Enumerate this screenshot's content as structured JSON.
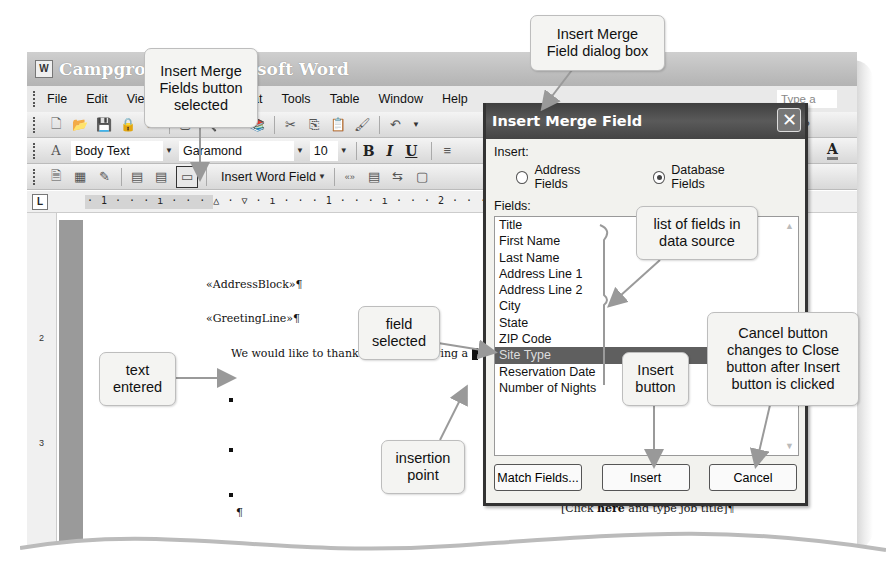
{
  "window": {
    "title": "Campground - Microsoft Word",
    "title_visible_left": "Campgroun",
    "title_visible_right": "Microsoft Word",
    "app_icon": "word-doc-icon"
  },
  "menubar": {
    "items": [
      "File",
      "Edit",
      "View",
      "Insert",
      "Format",
      "Tools",
      "Table",
      "Window",
      "Help"
    ],
    "ask_placeholder": "Type a que"
  },
  "formatting_toolbar": {
    "style": "Body Text",
    "font": "Garamond",
    "size": "10",
    "bold": "B",
    "italic": "I",
    "underline": "U",
    "font_color": "A"
  },
  "mail_merge_toolbar": {
    "insert_word_field": "Insert Word Field",
    "merge_field_glyph": "«»"
  },
  "ruler": {
    "marks": "· 1 · · · ı · · · △ · ▽ · ı · · · 1 · · · ı · · · 2 · · · ı",
    "tab_selector": "L"
  },
  "vertical_ruler": {
    "labels": [
      "2",
      "3"
    ]
  },
  "document": {
    "address_block": "«AddressBlock»¶",
    "greeting_line": "«GreetingLine»¶",
    "body_text": "We would like to thank you for reserving a",
    "para_mark": "¶",
    "job_title_placeholder": "[Click here and type job title]¶",
    "job_title_prefix": "[Click ",
    "job_title_bold": "here",
    "job_title_suffix": " and type job title]¶"
  },
  "dialog": {
    "title": "Insert Merge Field",
    "close_glyph": "✕",
    "insert_label": "Insert:",
    "radio_address": "Address Fields",
    "radio_database": "Database Fields",
    "radio_selected": "Database Fields",
    "fields_label": "Fields:",
    "fields": [
      "Title",
      "First Name",
      "Last Name",
      "Address Line 1",
      "Address Line 2",
      "City",
      "State",
      "ZIP Code",
      "Site Type",
      "Reservation Date",
      "Number of Nights"
    ],
    "selected_field": "Site Type",
    "buttons": {
      "match_fields": "Match Fields...",
      "insert": "Insert",
      "cancel": "Cancel"
    }
  },
  "callouts": {
    "insert_merge_fields_button": "Insert Merge\nFields button\nselected",
    "dialog_box": "Insert Merge\nField dialog box",
    "list_of_fields": "list of fields in\ndata source",
    "field_selected": "field\nselected",
    "text_entered": "text\nentered",
    "insertion_point": "insertion\npoint",
    "insert_button": "Insert\nbutton",
    "cancel_button": "Cancel button\nchanges to Close\nbutton after Insert\nbutton is clicked"
  }
}
